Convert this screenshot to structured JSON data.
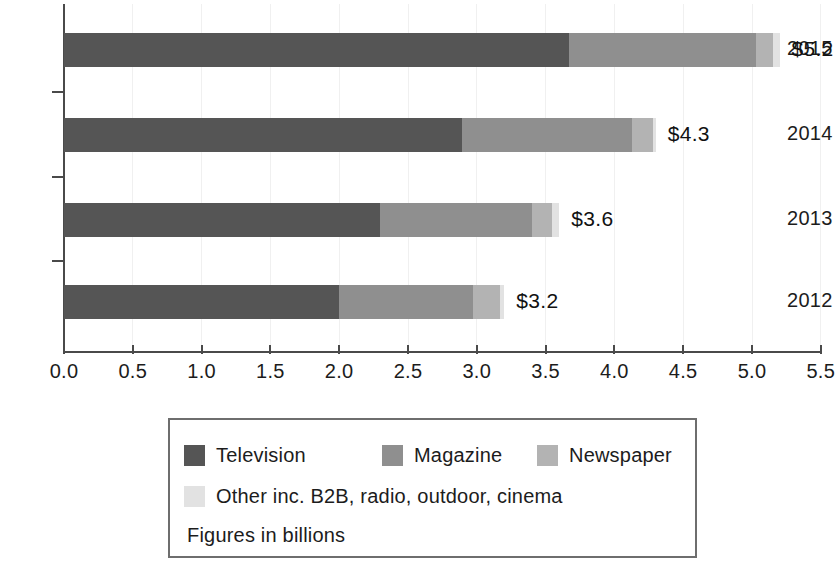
{
  "chart_data": {
    "type": "bar",
    "orientation": "horizontal",
    "stacked": true,
    "title": "",
    "xlabel": "",
    "ylabel": "",
    "xlim": [
      0.0,
      5.5
    ],
    "grid": true,
    "legend_position": "bottom",
    "categories": [
      "2015",
      "2014",
      "2013",
      "2012"
    ],
    "x_ticks": [
      "0.0",
      "0.5",
      "1.0",
      "1.5",
      "2.0",
      "2.5",
      "3.0",
      "3.5",
      "4.0",
      "4.5",
      "5.0",
      "5.5"
    ],
    "x_tick_values": [
      0.0,
      0.5,
      1.0,
      1.5,
      2.0,
      2.5,
      3.0,
      3.5,
      4.0,
      4.5,
      5.0,
      5.5
    ],
    "series": [
      {
        "name": "Television",
        "color": "#555555",
        "values": [
          3.67,
          2.89,
          2.3,
          2.0
        ]
      },
      {
        "name": "Magazine",
        "color": "#8f8f8f",
        "values": [
          1.36,
          1.24,
          1.1,
          0.97
        ]
      },
      {
        "name": "Newspaper",
        "color": "#b3b3b3",
        "values": [
          0.12,
          0.15,
          0.15,
          0.2
        ]
      },
      {
        "name": "Other inc. B2B, radio, outdoor, cinema",
        "color": "#e2e2e2",
        "values": [
          0.05,
          0.02,
          0.05,
          0.03
        ]
      }
    ],
    "totals": [
      5.2,
      4.3,
      3.6,
      3.2
    ],
    "data_labels": [
      "$5.2",
      "$4.3",
      "$3.6",
      "$3.2"
    ],
    "note": "Figures in billions"
  },
  "legend": {
    "entries": [
      {
        "label": "Television",
        "color": "#555555"
      },
      {
        "label": "Magazine",
        "color": "#8f8f8f"
      },
      {
        "label": "Newspaper",
        "color": "#b3b3b3"
      },
      {
        "label": "Other inc. B2B, radio, outdoor, cinema",
        "color": "#e2e2e2"
      }
    ],
    "note": "Figures in billions"
  }
}
